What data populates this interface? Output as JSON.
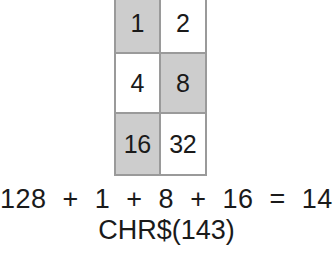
{
  "diagram": {
    "title_visible": false,
    "colors": {
      "background": "#ffffff",
      "cell_on": "#cdcdcd",
      "cell_off": "#ffffff",
      "border": "#9a9a9a",
      "text": "#1a1a1a"
    },
    "grid": {
      "columns": 2,
      "rows": 3,
      "clipped_at_top": true,
      "cells": [
        {
          "label": "1",
          "shaded": true
        },
        {
          "label": "2",
          "shaded": false
        },
        {
          "label": "4",
          "shaded": false
        },
        {
          "label": "8",
          "shaded": true
        },
        {
          "label": "16",
          "shaded": true
        },
        {
          "label": "32",
          "shaded": false
        }
      ]
    },
    "equation": "128  +  1  +  8  +  16  =  143",
    "chr_expression": "CHR$(143)"
  }
}
